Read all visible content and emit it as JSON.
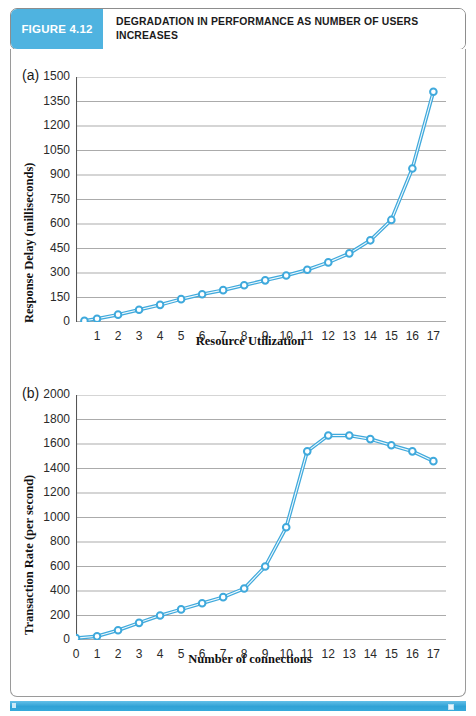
{
  "figure": {
    "badge_label": "FIGURE 4.12",
    "title": "DEGRADATION IN PERFORMANCE AS NUMBER OF USERS INCREASES",
    "badge_color": "#4FB3E0",
    "accent_color": "#2FA2D6",
    "series_color": "#3FA9DC",
    "marker_fill": "#FFFFFF",
    "grid_color": "#9C9C9C",
    "axis_color": "#555555"
  },
  "chart_data": [
    {
      "id": "a",
      "panel_label": "(a)",
      "type": "line",
      "title": "",
      "xlabel": "Resource Utilization",
      "ylabel": "Response Delay (milliseconds)",
      "xlim": [
        0,
        17.6
      ],
      "ylim": [
        0,
        1500
      ],
      "xticks": [
        0,
        1,
        2,
        3,
        4,
        5,
        6,
        7,
        8,
        9,
        10,
        11,
        12,
        13,
        14,
        15,
        16,
        17
      ],
      "xticklabels": [
        "",
        "1",
        "2",
        "3",
        "4",
        "5",
        "6",
        "7",
        "8",
        "9",
        "10",
        "11",
        "12",
        "13",
        "14",
        "15",
        "16",
        "17"
      ],
      "yticks": [
        0,
        150,
        300,
        450,
        600,
        750,
        900,
        1050,
        1200,
        1350,
        1500
      ],
      "yticklabels": [
        "0",
        "150",
        "300",
        "450",
        "600",
        "750",
        "900",
        "1050",
        "1200",
        "1350",
        "1500"
      ],
      "grid": "horizontal",
      "legend": "none",
      "x": [
        0.4,
        1,
        2,
        3,
        4,
        5,
        6,
        7,
        8,
        9,
        10,
        11,
        12,
        13,
        14,
        15,
        16,
        17
      ],
      "values": [
        8,
        20,
        45,
        75,
        105,
        140,
        170,
        195,
        225,
        255,
        285,
        320,
        365,
        420,
        500,
        625,
        940,
        1410
      ]
    },
    {
      "id": "b",
      "panel_label": "(b)",
      "type": "line",
      "title": "",
      "xlabel": "Number of connections",
      "ylabel": "Transaction Rate (per second)",
      "xlim": [
        0,
        17.6
      ],
      "ylim": [
        0,
        2000
      ],
      "xticks": [
        0,
        1,
        2,
        3,
        4,
        5,
        6,
        7,
        8,
        9,
        10,
        11,
        12,
        13,
        14,
        15,
        16,
        17
      ],
      "xticklabels": [
        "0",
        "1",
        "2",
        "3",
        "4",
        "5",
        "6",
        "7",
        "8",
        "9",
        "10",
        "11",
        "12",
        "13",
        "14",
        "15",
        "16",
        "17"
      ],
      "yticks": [
        0,
        200,
        400,
        600,
        800,
        1000,
        1200,
        1400,
        1600,
        1800,
        2000
      ],
      "yticklabels": [
        "0",
        "200",
        "400",
        "600",
        "800",
        "1000",
        "1200",
        "1400",
        "1600",
        "1800",
        "2000"
      ],
      "grid": "horizontal",
      "legend": "none",
      "x": [
        0,
        1,
        2,
        3,
        4,
        5,
        6,
        7,
        8,
        9,
        10,
        11,
        12,
        13,
        14,
        15,
        16,
        17
      ],
      "values": [
        15,
        30,
        80,
        140,
        200,
        250,
        300,
        350,
        420,
        600,
        920,
        1540,
        1670,
        1670,
        1640,
        1590,
        1540,
        1460
      ]
    }
  ]
}
